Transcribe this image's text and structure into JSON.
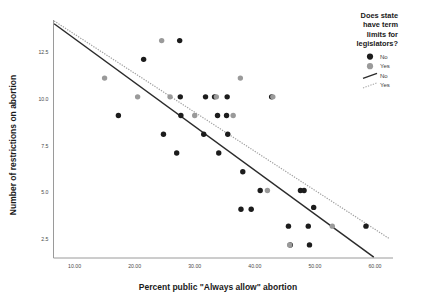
{
  "chart_data": {
    "type": "scatter",
    "title": "",
    "xlabel": "Percent public \"Always allow\" abortion",
    "ylabel": "Number of restrictions on abortion",
    "xlim": [
      6.5,
      63
    ],
    "ylim": [
      1.5,
      14.2
    ],
    "xticks": [
      "10.00",
      "20.00",
      "30.00",
      "40.00",
      "50.00",
      "60.00"
    ],
    "xtick_values": [
      10,
      20,
      30,
      40,
      50,
      60
    ],
    "yticks": [
      "2.5",
      "5.0",
      "7.5",
      "10.0",
      "12.5"
    ],
    "ytick_values": [
      2.5,
      5.0,
      7.5,
      10.0,
      12.5
    ],
    "grid": false,
    "legend_position": "top-right",
    "legend": {
      "title": "Does state have term limits for legislators?",
      "title_lines": [
        "Does state",
        "have term",
        "limits for",
        "legislators?"
      ],
      "entries": [
        {
          "label": "No",
          "kind": "marker",
          "color": "#1c1c1c"
        },
        {
          "label": "Yes",
          "kind": "marker",
          "color": "#9a9a9a"
        },
        {
          "label": "No",
          "kind": "line",
          "color": "#2b2b2b",
          "style": "solid"
        },
        {
          "label": "Yes",
          "kind": "line",
          "color": "#a8a8a8",
          "style": "dotted"
        }
      ]
    },
    "series": [
      {
        "name": "No",
        "color": "#1c1c1c",
        "marker": "filled-circle",
        "points": [
          [
            17.3,
            9.1
          ],
          [
            21.5,
            12.1
          ],
          [
            24.8,
            8.1
          ],
          [
            27.0,
            7.1
          ],
          [
            27.5,
            13.1
          ],
          [
            27.6,
            10.1
          ],
          [
            27.7,
            9.1
          ],
          [
            31.5,
            8.1
          ],
          [
            31.8,
            10.1
          ],
          [
            33.3,
            10.1
          ],
          [
            33.8,
            9.1
          ],
          [
            34.0,
            7.1
          ],
          [
            35.3,
            9.1
          ],
          [
            35.4,
            10.1
          ],
          [
            35.5,
            8.1
          ],
          [
            37.7,
            4.1
          ],
          [
            38.0,
            6.1
          ],
          [
            39.4,
            4.1
          ],
          [
            40.9,
            5.1
          ],
          [
            42.8,
            10.1
          ],
          [
            45.6,
            3.2
          ],
          [
            45.9,
            2.2
          ],
          [
            47.6,
            5.1
          ],
          [
            48.2,
            5.1
          ],
          [
            48.9,
            3.2
          ],
          [
            49.1,
            2.2
          ],
          [
            49.8,
            4.2
          ],
          [
            58.5,
            3.2
          ]
        ]
      },
      {
        "name": "Yes",
        "color": "#9a9a9a",
        "marker": "filled-circle",
        "points": [
          [
            15.0,
            11.1
          ],
          [
            20.5,
            10.1
          ],
          [
            24.5,
            13.1
          ],
          [
            25.9,
            10.1
          ],
          [
            30.0,
            9.1
          ],
          [
            33.6,
            10.1
          ],
          [
            36.4,
            9.1
          ],
          [
            37.6,
            11.1
          ],
          [
            42.1,
            5.1
          ],
          [
            43.0,
            10.1
          ],
          [
            45.8,
            2.2
          ],
          [
            52.9,
            3.2
          ]
        ]
      }
    ],
    "fit_lines": [
      {
        "name": "No",
        "style": "solid",
        "color": "#2b2b2b",
        "x0": 6.6,
        "y0": 14.0,
        "x1": 59.8,
        "y1": 1.55
      },
      {
        "name": "Yes",
        "style": "dotted",
        "color": "#a0a0a0",
        "x0": 6.6,
        "y0": 14.15,
        "x1": 62.3,
        "y1": 2.55
      }
    ]
  }
}
